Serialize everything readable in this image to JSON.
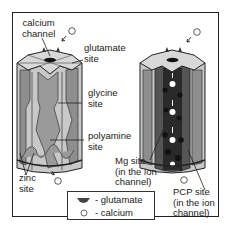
{
  "figure": {
    "type": "diagram",
    "colors": {
      "frame": "#222222",
      "cylinder_light": "#c8c8c8",
      "cylinder_mid": "#8e8e8e",
      "cylinder_dark": "#555555",
      "channel_dark": "#2a2a2a",
      "top_face": "#d8d8d8"
    }
  },
  "left_channel": {
    "state": "closed",
    "labels": {
      "calcium_channel": [
        "calcium",
        "channel"
      ],
      "glutamate_site": [
        "glutamate",
        "site"
      ],
      "glycine_site": [
        "glycine",
        "site"
      ],
      "polyamine_site": [
        "polyamine",
        "site"
      ],
      "zinc_site": [
        "zinc",
        "site"
      ]
    }
  },
  "right_channel": {
    "state": "open",
    "labels": {
      "mg_site": [
        "Mg site",
        "(in the ion",
        "channel)"
      ],
      "pcp_site": [
        "PCP site",
        "(in the ion",
        "channel)"
      ]
    }
  },
  "legend": {
    "items": [
      {
        "icon": "glutamate-shape-icon",
        "label": "- glutamate"
      },
      {
        "icon": "calcium-circle-icon",
        "label": "- calcium"
      }
    ]
  }
}
